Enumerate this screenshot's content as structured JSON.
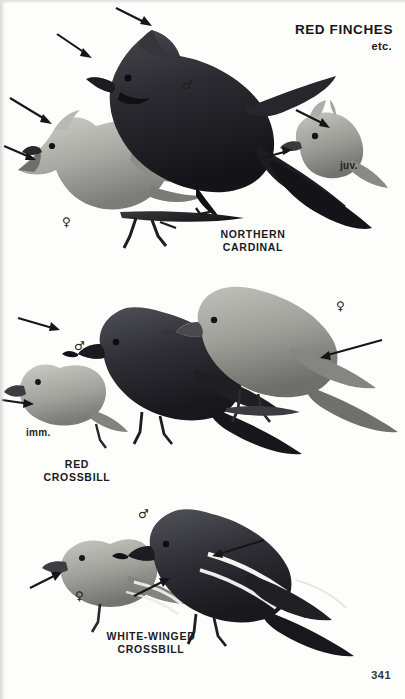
{
  "plate": {
    "title_main": "RED FINCHES",
    "title_sub": "etc.",
    "page_number": "341",
    "background_color": "#fdfdfc",
    "ink_color": "#15151a"
  },
  "panels": [
    {
      "id": "northern-cardinal",
      "species_label": "NORTHERN\nCARDINAL",
      "annotations": [
        {
          "name": "male-symbol",
          "symbol": "♂",
          "x": 182,
          "y": 79
        },
        {
          "name": "female-symbol",
          "symbol": "♀",
          "x": 62,
          "y": 216
        },
        {
          "name": "juvenile-label",
          "text": "juv.",
          "x": 340,
          "y": 160
        }
      ],
      "birds": [
        {
          "name": "adult-male-cardinal",
          "plumage": "male"
        },
        {
          "name": "adult-female-cardinal",
          "plumage": "female"
        },
        {
          "name": "juvenile-cardinal",
          "plumage": "juvenile"
        }
      ],
      "arrows": [
        {
          "name": "arrow-to-male-crest",
          "x1": 116,
          "y1": 8,
          "x2": 152,
          "y2": 26
        },
        {
          "name": "arrow-to-male-bill",
          "x1": 57,
          "y1": 34,
          "x2": 92,
          "y2": 58
        },
        {
          "name": "arrow-to-female-crest",
          "x1": 10,
          "y1": 98,
          "x2": 52,
          "y2": 124
        },
        {
          "name": "arrow-to-female-bill",
          "x1": 4,
          "y1": 146,
          "x2": 36,
          "y2": 160
        },
        {
          "name": "arrow-to-juvenile-bill",
          "x1": 296,
          "y1": 110,
          "x2": 330,
          "y2": 128
        },
        {
          "name": "arrow-to-juvenile-face",
          "x1": 262,
          "y1": 158,
          "x2": 292,
          "y2": 150
        }
      ]
    },
    {
      "id": "red-crossbill",
      "species_label": "RED\nCROSSBILL",
      "annotations": [
        {
          "name": "male-symbol",
          "symbol": "♂",
          "x": 74,
          "y": 340
        },
        {
          "name": "female-symbol",
          "symbol": "♀",
          "x": 336,
          "y": 300
        },
        {
          "name": "immature-label",
          "text": "imm.",
          "x": 26,
          "y": 427
        }
      ],
      "birds": [
        {
          "name": "adult-male-red-crossbill",
          "plumage": "male"
        },
        {
          "name": "adult-female-red-crossbill",
          "plumage": "female"
        },
        {
          "name": "immature-red-crossbill",
          "plumage": "immature"
        }
      ],
      "arrows": [
        {
          "name": "arrow-to-male-bill",
          "x1": 18,
          "y1": 318,
          "x2": 60,
          "y2": 330
        },
        {
          "name": "arrow-to-female-flank",
          "x1": 380,
          "y1": 340,
          "x2": 320,
          "y2": 358
        },
        {
          "name": "arrow-to-immature-bill",
          "x1": 2,
          "y1": 400,
          "x2": 34,
          "y2": 404
        }
      ]
    },
    {
      "id": "white-winged-crossbill",
      "species_label": "WHITE-WINGED\nCROSSBILL",
      "annotations": [
        {
          "name": "male-symbol",
          "symbol": "♂",
          "x": 138,
          "y": 508
        },
        {
          "name": "female-symbol",
          "symbol": "♀",
          "x": 75,
          "y": 590
        }
      ],
      "birds": [
        {
          "name": "adult-male-white-winged-crossbill",
          "plumage": "male"
        },
        {
          "name": "adult-female-white-winged-crossbill",
          "plumage": "female"
        }
      ],
      "arrows": [
        {
          "name": "arrow-to-male-wingbar",
          "x1": 262,
          "y1": 540,
          "x2": 212,
          "y2": 556
        },
        {
          "name": "arrow-to-female-wingbar",
          "x1": 134,
          "y1": 596,
          "x2": 170,
          "y2": 578
        },
        {
          "name": "arrow-to-female-bill",
          "x1": 30,
          "y1": 588,
          "x2": 62,
          "y2": 572
        }
      ]
    }
  ]
}
